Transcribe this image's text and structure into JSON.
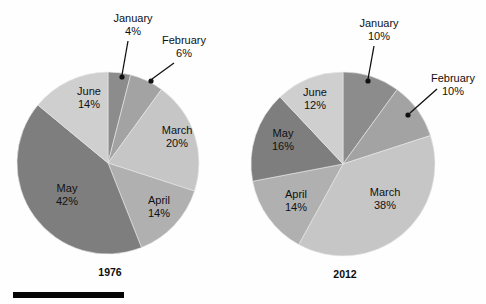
{
  "figure": {
    "background": "#fefefe",
    "scale_bar": {
      "name": "scale-bar",
      "color": "#050505",
      "x": 13,
      "y": 292,
      "width": 111,
      "height": 6
    }
  },
  "palette": {
    "january": "#8c8c8c",
    "february": "#a3a3a3",
    "march": "#c6c6c6",
    "april": "#b0b0b0",
    "may": "#7e7e7e",
    "june": "#cfcfcf",
    "label_text": "#111111",
    "leader_line": "#111111"
  },
  "chart_data": [
    {
      "type": "pie",
      "title": "1976",
      "categories": [
        "January",
        "February",
        "March",
        "April",
        "May",
        "June"
      ],
      "values": [
        4,
        6,
        20,
        14,
        42,
        14
      ],
      "value_labels": [
        "4%",
        "6%",
        "20%",
        "14%",
        "42%",
        "14%"
      ],
      "colors": [
        "#8c8c8c",
        "#a3a3a3",
        "#c6c6c6",
        "#b0b0b0",
        "#7e7e7e",
        "#cfcfcf"
      ],
      "start_angle_deg": 0,
      "direction": "clockwise",
      "center": {
        "x": 108,
        "y": 163
      },
      "radius": 91,
      "legend": "none",
      "labels": [
        {
          "name": "slice-label-january",
          "text": "January",
          "value": "4%",
          "placement": "outside-callout",
          "text_x": 133,
          "text_y": 22,
          "value_x": 133,
          "value_y": 35,
          "dot_x": 122,
          "dot_y": 77,
          "line_from_x": 128,
          "line_from_y": 41,
          "line_to_x": 122,
          "line_to_y": 75
        },
        {
          "name": "slice-label-february",
          "text": "February",
          "value": "6%",
          "placement": "outside-callout",
          "text_x": 184,
          "text_y": 44,
          "value_x": 184,
          "value_y": 57,
          "dot_x": 151,
          "dot_y": 81,
          "line_from_x": 174,
          "line_from_y": 63,
          "line_to_x": 152,
          "line_to_y": 79
        },
        {
          "name": "slice-label-march",
          "text": "March",
          "value": "20%",
          "placement": "inside",
          "text_x": 177,
          "text_y": 134,
          "value_x": 177,
          "value_y": 147
        },
        {
          "name": "slice-label-april",
          "text": "April",
          "value": "14%",
          "placement": "inside",
          "text_x": 159,
          "text_y": 204,
          "value_x": 159,
          "value_y": 217
        },
        {
          "name": "slice-label-may",
          "text": "May",
          "value": "42%",
          "placement": "inside",
          "text_x": 67,
          "text_y": 192,
          "value_x": 67,
          "value_y": 205
        },
        {
          "name": "slice-label-june",
          "text": "June",
          "value": "14%",
          "placement": "inside",
          "text_x": 89,
          "text_y": 95,
          "value_x": 89,
          "value_y": 108
        }
      ]
    },
    {
      "type": "pie",
      "title": "2012",
      "categories": [
        "January",
        "February",
        "March",
        "April",
        "May",
        "June"
      ],
      "values": [
        10,
        10,
        38,
        14,
        16,
        12
      ],
      "value_labels": [
        "10%",
        "10%",
        "38%",
        "14%",
        "16%",
        "12%"
      ],
      "colors": [
        "#8c8c8c",
        "#a3a3a3",
        "#c6c6c6",
        "#b0b0b0",
        "#7e7e7e",
        "#cfcfcf"
      ],
      "start_angle_deg": 0,
      "direction": "clockwise",
      "center": {
        "x": 343,
        "y": 164
      },
      "radius": 92,
      "legend": "none",
      "labels": [
        {
          "name": "slice-label-january",
          "text": "January",
          "value": "10%",
          "placement": "outside-callout",
          "text_x": 379,
          "text_y": 27,
          "value_x": 379,
          "value_y": 40,
          "dot_x": 368,
          "dot_y": 81,
          "line_from_x": 374,
          "line_from_y": 46,
          "line_to_x": 368,
          "line_to_y": 79
        },
        {
          "name": "slice-label-february",
          "text": "February",
          "value": "10%",
          "placement": "outside-callout",
          "text_x": 453,
          "text_y": 82,
          "value_x": 453,
          "value_y": 95,
          "dot_x": 408,
          "dot_y": 115,
          "line_from_x": 437,
          "line_from_y": 89,
          "line_to_x": 410,
          "line_to_y": 113
        },
        {
          "name": "slice-label-march",
          "text": "March",
          "value": "38%",
          "placement": "inside",
          "text_x": 385,
          "text_y": 196,
          "value_x": 385,
          "value_y": 209
        },
        {
          "name": "slice-label-april",
          "text": "April",
          "value": "14%",
          "placement": "inside",
          "text_x": 296,
          "text_y": 198,
          "value_x": 296,
          "value_y": 211
        },
        {
          "name": "slice-label-may",
          "text": "May",
          "value": "16%",
          "placement": "inside",
          "text_x": 283,
          "text_y": 137,
          "value_x": 283,
          "value_y": 150
        },
        {
          "name": "slice-label-june",
          "text": "June",
          "value": "12%",
          "placement": "inside",
          "text_x": 315,
          "text_y": 96,
          "value_x": 315,
          "value_y": 109
        }
      ]
    }
  ]
}
